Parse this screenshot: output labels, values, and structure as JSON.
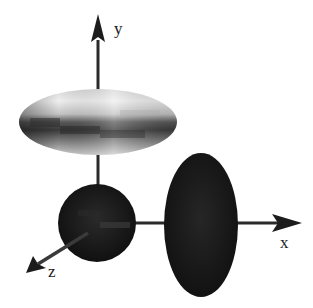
{
  "figure": {
    "axes": {
      "x": {
        "label": "x"
      },
      "y": {
        "label": "y"
      },
      "z": {
        "label": "z"
      }
    },
    "shapes": [
      {
        "name": "flattened-ellipsoid",
        "position": "on y-axis above origin",
        "shading": "light gray top, dark banded bottom"
      },
      {
        "name": "sphere",
        "position": "origin",
        "shading": "near black"
      },
      {
        "name": "tall-ellipsoid",
        "position": "on x-axis",
        "shading": "near black"
      }
    ],
    "colors": {
      "axis": "#2a2a2a",
      "dark_shape": "#141414",
      "light_shape": "#e8e8e8",
      "background": "#ffffff"
    },
    "caption": ""
  }
}
